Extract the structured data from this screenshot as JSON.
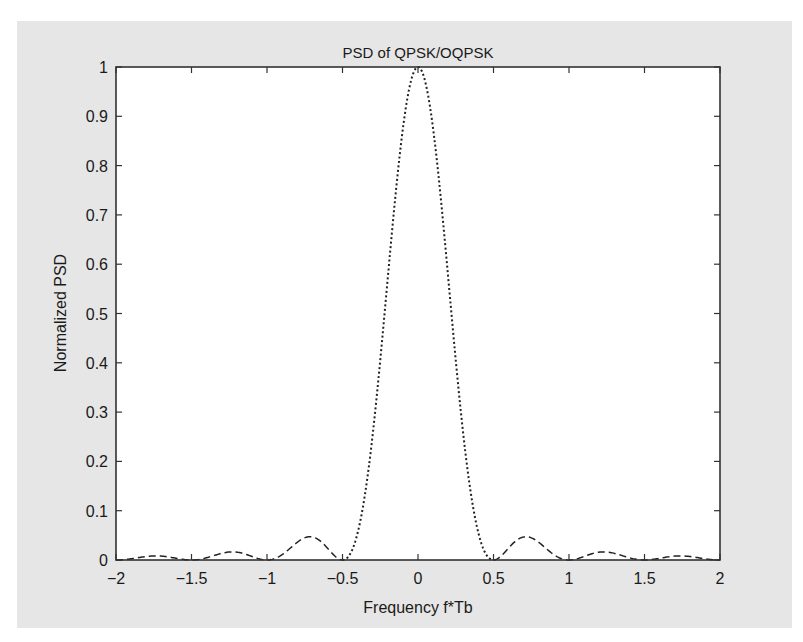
{
  "chart_data": {
    "type": "line",
    "title": "PSD of QPSK/OQPSK",
    "xlabel": "Frequency f*Tb",
    "ylabel": "Normalized PSD",
    "xlim": [
      -2,
      2
    ],
    "ylim": [
      0,
      1
    ],
    "xticks": [
      -2,
      -1.5,
      -1,
      -0.5,
      0,
      0.5,
      1,
      1.5,
      2
    ],
    "xtick_labels": [
      "−2",
      "−1.5",
      "−1",
      "−0.5",
      "0",
      "0.5",
      "1",
      "1.5",
      "2"
    ],
    "yticks": [
      0,
      0.1,
      0.2,
      0.3,
      0.4,
      0.5,
      0.6,
      0.7,
      0.8,
      0.9,
      1
    ],
    "ytick_labels": [
      "0",
      "0.1",
      "0.2",
      "0.3",
      "0.4",
      "0.5",
      "0.6",
      "0.7",
      "0.8",
      "0.9",
      "1"
    ],
    "grid": false,
    "legend": null,
    "series": [
      {
        "name": "QPSK/OQPSK PSD (main lobe)",
        "style": "dotted",
        "x": [
          -0.5,
          -0.45,
          -0.4,
          -0.35,
          -0.3,
          -0.25,
          -0.2,
          -0.15,
          -0.1,
          -0.05,
          0,
          0.05,
          0.1,
          0.15,
          0.2,
          0.25,
          0.3,
          0.35,
          0.4,
          0.45,
          0.5
        ],
        "y": [
          0.0,
          0.0095,
          0.0358,
          0.0744,
          0.1189,
          0.1623,
          0.1974,
          0.2185,
          0.2211,
          0.2026,
          1.0,
          0.9675,
          0.8751,
          0.7368,
          0.5728,
          0.4053,
          0.2546,
          0.1356,
          0.0551,
          0.0118,
          0.0
        ]
      },
      {
        "name": "QPSK/OQPSK PSD (sidelobes)",
        "style": "dashed",
        "peaks": [
          {
            "x": -1.74,
            "y": 0.008
          },
          {
            "x": -1.23,
            "y": 0.016
          },
          {
            "x": -0.72,
            "y": 0.047
          },
          {
            "x": 0.72,
            "y": 0.047
          },
          {
            "x": 1.23,
            "y": 0.016
          },
          {
            "x": 1.74,
            "y": 0.008
          }
        ],
        "nulls": [
          -2,
          -1.5,
          -1,
          -0.5,
          0.5,
          1,
          1.5,
          2
        ]
      }
    ],
    "formula": "y = (sin(2*pi*f)/(2*pi*f))^2"
  },
  "colors": {
    "figure_background": "#e6e6e6",
    "axes_background": "#ffffff",
    "line": "#222222",
    "axis": "#333333"
  }
}
